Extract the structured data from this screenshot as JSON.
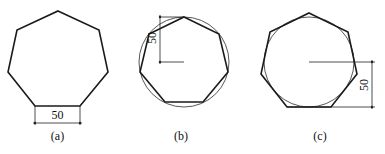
{
  "figures": [
    {
      "id": "a",
      "caption": "(a)",
      "shape": "regular heptagon",
      "dimension_label": "50",
      "dimension_meaning": "side length",
      "dimension_orientation": "horizontal"
    },
    {
      "id": "b",
      "caption": "(b)",
      "shape": "regular heptagon inscribed in circle",
      "dimension_label": "50",
      "dimension_meaning": "circumradius",
      "dimension_orientation": "vertical"
    },
    {
      "id": "c",
      "caption": "(c)",
      "shape": "regular heptagon circumscribed about circle",
      "dimension_label": "50",
      "dimension_meaning": "inradius",
      "dimension_orientation": "vertical"
    }
  ],
  "colors": {
    "stroke": "#1a1a1a",
    "background": "#ffffff"
  }
}
